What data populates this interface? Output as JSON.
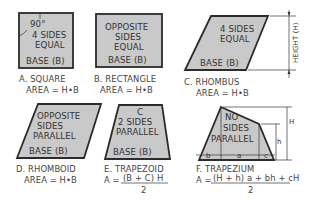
{
  "figures": [
    {
      "id": "A",
      "name": "SQUARE",
      "caption": "A. SQUARE",
      "formula": "AREA = H•B",
      "inner_lines": [
        "90°",
        "4 SIDES",
        "EQUAL"
      ],
      "base_label": "BASE (B)"
    },
    {
      "id": "B",
      "name": "RECTANGLE",
      "caption": "B. RECTANGLE",
      "formula": "AREA = H•B",
      "inner_lines": [
        "OPPOSITE",
        "SIDES",
        "EQUAL"
      ],
      "base_label": "BASE (B)"
    },
    {
      "id": "C",
      "name": "RHOMBUS",
      "caption": "C. RHOMBUS",
      "formula": "AREA = H•B",
      "inner_lines": [
        "4 SIDES",
        "EQUAL"
      ],
      "base_label": "BASE (B)",
      "dimension_label": "HEIGHT (H)"
    },
    {
      "id": "D",
      "name": "RHOMBOID",
      "caption": "D. RHOMBOID",
      "formula": "AREA = H•B",
      "inner_lines": [
        "OPPOSITE",
        "SIDES",
        "PARALLEL"
      ],
      "base_label": "BASE (B)"
    },
    {
      "id": "E",
      "name": "TRAPEZOID",
      "caption": "E. TRAPEZOID",
      "formula_prefix": "A =",
      "formula_numerator": "(B + C) H",
      "formula_denominator": "2",
      "inner_lines": [
        "C",
        "2 SIDES",
        "PARALLEL"
      ],
      "base_label": "BASE (B)"
    },
    {
      "id": "F",
      "name": "TRAPEZIUM",
      "caption": "F. TRAPEZIUM",
      "formula_prefix": "A =",
      "formula_numerator": "(H + h) a + bh + cH",
      "formula_denominator": "2",
      "inner_lines": [
        "NO",
        "SIDES",
        "PARALLEL"
      ],
      "dimension_labels": {
        "H": "H",
        "h": "h",
        "a": "a",
        "b": "b",
        "c": "c"
      }
    }
  ],
  "colors": {
    "fill": "#c9c9c9",
    "stroke": "#2b2b2b",
    "text": "#3b3b3b",
    "background": "#ffffff"
  }
}
